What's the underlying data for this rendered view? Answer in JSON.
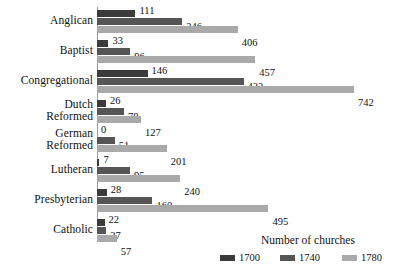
{
  "chart_data": {
    "type": "bar",
    "orientation": "horizontal",
    "title": "",
    "xlabel": "",
    "ylabel": "",
    "legend_title": "Number of churches",
    "legend_position": "bottom-right",
    "grid": false,
    "xlim": [
      0,
      742
    ],
    "categories": [
      "Anglican",
      "Baptist",
      "Congregational",
      "Dutch Reformed",
      "German Reformed",
      "Lutheran",
      "Presbyterian",
      "Catholic"
    ],
    "category_lines": [
      [
        "Anglican",
        ""
      ],
      [
        "Baptist",
        ""
      ],
      [
        "Congregational",
        ""
      ],
      [
        "Dutch",
        "Reformed"
      ],
      [
        "German",
        "Reformed"
      ],
      [
        "Lutheran",
        ""
      ],
      [
        "Presbyterian",
        ""
      ],
      [
        "Catholic",
        ""
      ]
    ],
    "series": [
      {
        "name": "1700",
        "color": "#3b3b3b",
        "values": [
          111,
          33,
          146,
          26,
          0,
          7,
          28,
          22
        ]
      },
      {
        "name": "1740",
        "color": "#555555",
        "values": [
          246,
          96,
          423,
          78,
          51,
          95,
          160,
          27
        ]
      },
      {
        "name": "1780",
        "color": "#a9a9a9",
        "values": [
          406,
          457,
          742,
          127,
          201,
          240,
          495,
          57
        ]
      }
    ],
    "data_labels": [
      {
        "category": "Anglican",
        "series": "1700",
        "value": 111
      },
      {
        "category": "Anglican",
        "series": "1740",
        "value": 246
      },
      {
        "category": "Anglican",
        "series": "1780",
        "value": 406
      },
      {
        "category": "Baptist",
        "series": "1700",
        "value": 33
      },
      {
        "category": "Baptist",
        "series": "1740",
        "value": 96
      },
      {
        "category": "Baptist",
        "series": "1780",
        "value": 457
      },
      {
        "category": "Congregational",
        "series": "1700",
        "value": 146
      },
      {
        "category": "Congregational",
        "series": "1740",
        "value": 423
      },
      {
        "category": "Congregational",
        "series": "1780",
        "value": 742
      },
      {
        "category": "Dutch Reformed",
        "series": "1700",
        "value": 26
      },
      {
        "category": "Dutch Reformed",
        "series": "1740",
        "value": 78
      },
      {
        "category": "Dutch Reformed",
        "series": "1780",
        "value": 127
      },
      {
        "category": "German Reformed",
        "series": "1700",
        "value": 0
      },
      {
        "category": "German Reformed",
        "series": "1740",
        "value": 51
      },
      {
        "category": "German Reformed",
        "series": "1780",
        "value": 201
      },
      {
        "category": "Lutheran",
        "series": "1700",
        "value": 7
      },
      {
        "category": "Lutheran",
        "series": "1740",
        "value": 95
      },
      {
        "category": "Lutheran",
        "series": "1780",
        "value": 240
      },
      {
        "category": "Presbyterian",
        "series": "1700",
        "value": 28
      },
      {
        "category": "Presbyterian",
        "series": "1740",
        "value": 160
      },
      {
        "category": "Presbyterian",
        "series": "1780",
        "value": 495
      },
      {
        "category": "Catholic",
        "series": "1700",
        "value": 22
      },
      {
        "category": "Catholic",
        "series": "1740",
        "value": 27
      },
      {
        "category": "Catholic",
        "series": "1780",
        "value": 57
      }
    ]
  },
  "layout": {
    "group_tops": [
      3,
      33,
      63,
      93,
      122,
      152,
      182,
      212
    ],
    "bar_height": 6.5,
    "bar_gap": 1.5,
    "px_per_unit": 0.3464,
    "label_offset": 4
  }
}
